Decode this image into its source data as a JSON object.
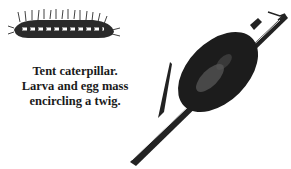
{
  "caption": {
    "lines": [
      "Tent caterpillar.",
      "Larva and egg mass",
      "encircling a twig."
    ]
  },
  "illustrations": [
    {
      "name": "caterpillar-larva",
      "description": "hairy caterpillar drawing"
    },
    {
      "name": "egg-mass-on-twig",
      "description": "dark egg mass encircling diagonal twig"
    }
  ]
}
